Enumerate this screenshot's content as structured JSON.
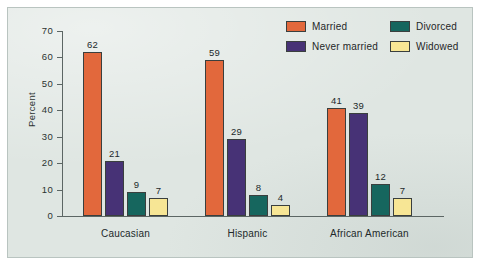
{
  "chart_data": {
    "type": "bar",
    "title": "",
    "xlabel": "",
    "ylabel": "Percent",
    "ylim": [
      0,
      70
    ],
    "yticks": [
      0,
      10,
      20,
      30,
      40,
      50,
      60,
      70
    ],
    "grid": false,
    "legend_position": "top-right",
    "categories": [
      "Caucasian",
      "Hispanic",
      "African American"
    ],
    "series": [
      {
        "name": "Married",
        "color": "#e2683c",
        "values": [
          62,
          59,
          41
        ]
      },
      {
        "name": "Never married",
        "color": "#473276",
        "values": [
          21,
          29,
          39
        ]
      },
      {
        "name": "Divorced",
        "color": "#16665e",
        "values": [
          9,
          8,
          12
        ]
      },
      {
        "name": "Widowed",
        "color": "#f7e695",
        "values": [
          7,
          4,
          7
        ]
      }
    ]
  },
  "legend": {
    "items": [
      {
        "label": "Married",
        "swatch": "legend-swatch-married"
      },
      {
        "label": "Divorced",
        "swatch": "legend-swatch-divorced"
      },
      {
        "label": "Never married",
        "swatch": "legend-swatch-never-married"
      },
      {
        "label": "Widowed",
        "swatch": "legend-swatch-widowed"
      }
    ]
  },
  "axes": {
    "y_label": "Percent",
    "y_ticks": [
      "0",
      "10",
      "20",
      "30",
      "40",
      "50",
      "60",
      "70"
    ],
    "x_categories": [
      "Caucasian",
      "Hispanic",
      "African American"
    ]
  },
  "values": {
    "caucasian": {
      "married": "62",
      "never_married": "21",
      "divorced": "9",
      "widowed": "7"
    },
    "hispanic": {
      "married": "59",
      "never_married": "29",
      "divorced": "8",
      "widowed": "4"
    },
    "african_american": {
      "married": "41",
      "never_married": "39",
      "divorced": "12",
      "widowed": "7"
    }
  },
  "colors": {
    "married": "#e2683c",
    "never_married": "#473276",
    "divorced": "#16665e",
    "widowed": "#f7e695",
    "plate_background": "#dfe6e2",
    "axis": "#5c6664"
  }
}
